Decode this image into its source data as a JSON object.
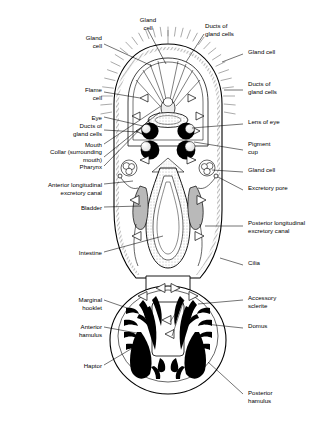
{
  "figure": {
    "type": "labelled-biological-diagram",
    "width": 336,
    "height": 428,
    "background_color": "#ffffff",
    "ink_color": "#000000",
    "fill_grey": "#b8b8b8",
    "stipple_grey": "#d8d8d8"
  },
  "labels_left": [
    {
      "id": "gland-cell-upper-left",
      "text": "Gland\ncell",
      "x": 56,
      "y": 34,
      "w": 46
    },
    {
      "id": "flame-cell",
      "text": "Flame\ncell",
      "x": 46,
      "y": 86,
      "w": 56
    },
    {
      "id": "eye",
      "text": "Eye",
      "x": 46,
      "y": 114,
      "w": 56
    },
    {
      "id": "ducts-of-gland-cells-left",
      "text": "Ducts of\ngland cells",
      "x": 36,
      "y": 122,
      "w": 66
    },
    {
      "id": "mouth",
      "text": "Mouth",
      "x": 36,
      "y": 141,
      "w": 66
    },
    {
      "id": "collar-surrounding-mouth",
      "text": "Collar (surrounding\nmouth)",
      "x": 14,
      "y": 148,
      "w": 88
    },
    {
      "id": "pharynx",
      "text": "Pharynx",
      "x": 36,
      "y": 163,
      "w": 66
    },
    {
      "id": "anterior-longitudinal-excretory-canal",
      "text": "Anterior longitudinal\nexcretory canal",
      "x": 10,
      "y": 181,
      "w": 92
    },
    {
      "id": "bladder",
      "text": "Bladder",
      "x": 36,
      "y": 204,
      "w": 66
    },
    {
      "id": "intestine",
      "text": "Intestine",
      "x": 36,
      "y": 249,
      "w": 66
    },
    {
      "id": "marginal-hooklet",
      "text": "Marginal\nhooklet",
      "x": 36,
      "y": 296,
      "w": 66
    },
    {
      "id": "anterior-hamulus",
      "text": "Anterior\nhamulus",
      "x": 36,
      "y": 323,
      "w": 66
    },
    {
      "id": "haptor",
      "text": "Haptor",
      "x": 36,
      "y": 362,
      "w": 66
    }
  ],
  "labels_top": [
    {
      "id": "gland-cell-top",
      "text": "Gland\ncell",
      "x": 126,
      "y": 16,
      "w": 44
    },
    {
      "id": "ducts-of-gland-cells-top",
      "text": "Ducts of\ngland cells",
      "x": 205,
      "y": 22,
      "w": 60
    }
  ],
  "labels_right": [
    {
      "id": "gland-cell-right",
      "text": "Gland cell",
      "x": 245,
      "y": 51,
      "w": 88
    },
    {
      "id": "ducts-of-gland-cells-right",
      "text": "Ducts of\ngland cells",
      "x": 245,
      "y": 83,
      "w": 88
    },
    {
      "id": "lens-of-eye",
      "text": "Lens of eye",
      "x": 245,
      "y": 121,
      "w": 88
    },
    {
      "id": "pigment-cup",
      "text": "Pigment\ncup",
      "x": 245,
      "y": 143,
      "w": 88
    },
    {
      "id": "gland-cell-mid-right",
      "text": "Gland cell",
      "x": 245,
      "y": 169,
      "w": 88
    },
    {
      "id": "excretory-pore",
      "text": "Excretory pore",
      "x": 245,
      "y": 187,
      "w": 88
    },
    {
      "id": "posterior-longitudinal-excretory-canal",
      "text": "Posterior longitudinal\nexcretory canal",
      "x": 245,
      "y": 222,
      "w": 90
    },
    {
      "id": "cilia",
      "text": "Cilia",
      "x": 245,
      "y": 262,
      "w": 88
    },
    {
      "id": "accessory-sclerite",
      "text": "Accessory\nsclerite",
      "x": 245,
      "y": 297,
      "w": 88
    },
    {
      "id": "domus",
      "text": "Domus",
      "x": 245,
      "y": 325,
      "w": 88
    },
    {
      "id": "posterior-hamulus",
      "text": "Posterior\nhamulus",
      "x": 245,
      "y": 392,
      "w": 88
    }
  ]
}
